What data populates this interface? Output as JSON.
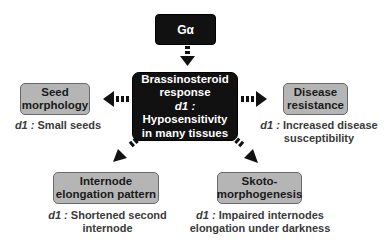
{
  "top_node": {
    "label": "Gα"
  },
  "center_node": {
    "title_line1": "Brassinosteroid",
    "title_line2": "response",
    "mutant": "d1 :",
    "phenotype_line1": "Hyposensitivity",
    "phenotype_line2": "in many tissues"
  },
  "nodes": [
    {
      "id": "seed",
      "line1": "Seed",
      "line2": "morphology",
      "mutant": "d1 :",
      "caption_line1": "Small seeds",
      "caption_line2": ""
    },
    {
      "id": "disease",
      "line1": "Disease",
      "line2": "resistance",
      "mutant": "d1 :",
      "caption_line1": "Increased disease",
      "caption_line2": "susceptibility"
    },
    {
      "id": "internode",
      "line1": "Internode",
      "line2": "elongation pattern",
      "mutant": "d1 :",
      "caption_line1": "Shortened second",
      "caption_line2": "internode"
    },
    {
      "id": "skoto",
      "line1": "Skoto-",
      "line2": "morphogenesis",
      "mutant": "d1 :",
      "caption_line1": "Impaired internodes",
      "caption_line2": "elongation under darkness"
    }
  ],
  "colors": {
    "dark_box": "#111111",
    "gray_box": "#b5b5b5",
    "arrow": "#111111"
  }
}
